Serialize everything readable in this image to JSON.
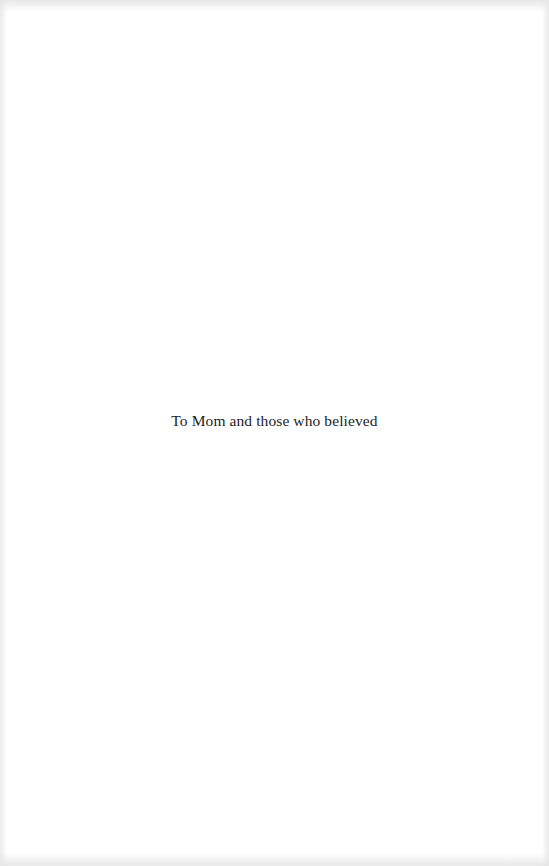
{
  "page": {
    "type": "dedication",
    "background_color": "#ffffff",
    "text_color": "#1e1e1e",
    "dedication_text": "To Mom and those who believed"
  }
}
